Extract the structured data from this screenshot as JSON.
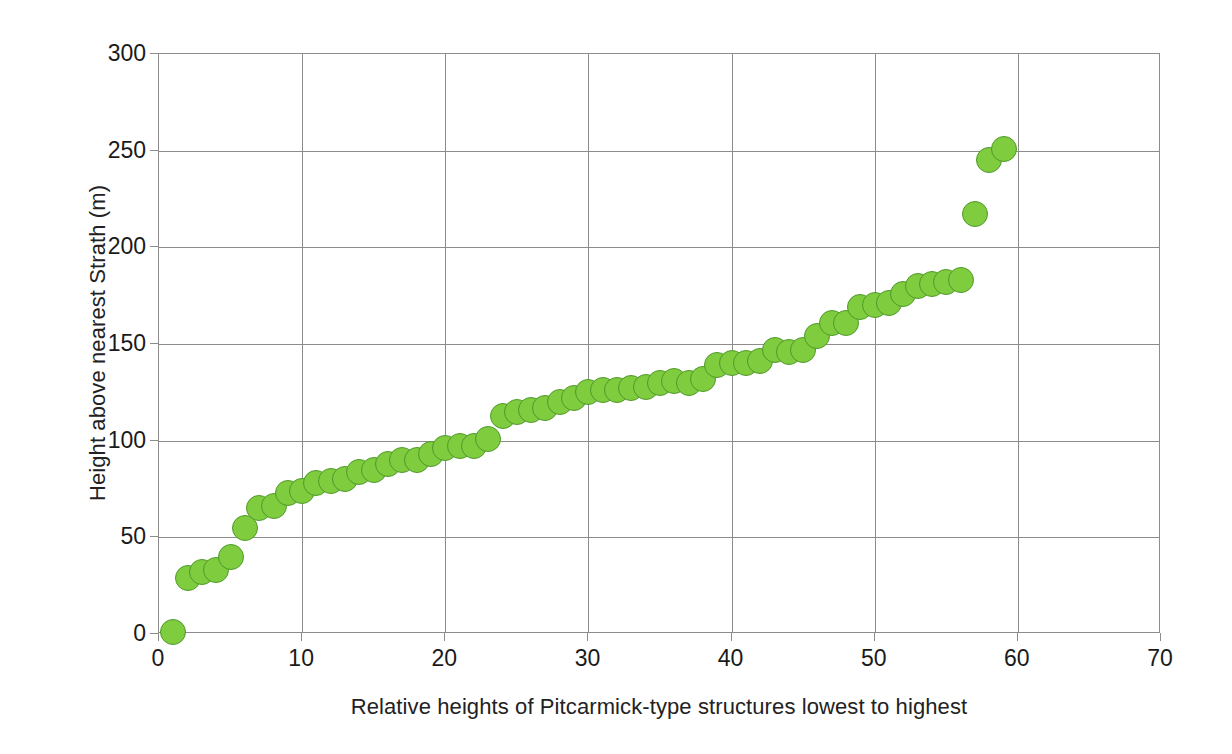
{
  "chart_data": {
    "type": "scatter",
    "title": "",
    "xlabel": "Relative heights of Pitcarmick-type structures lowest to highest",
    "ylabel": "Height above nearest Strath (m)",
    "xlim": [
      0,
      70
    ],
    "ylim": [
      0,
      300
    ],
    "xticks": [
      0,
      10,
      20,
      30,
      40,
      50,
      60,
      70
    ],
    "yticks": [
      0,
      50,
      100,
      150,
      200,
      250,
      300
    ],
    "grid": true,
    "legend": false,
    "marker": {
      "shape": "circle",
      "fill_color": "#7fcc3e",
      "edge_color": "#4e9a2a",
      "size_px": 26
    },
    "series": [
      {
        "name": "Pitcarmick-type structures",
        "points": [
          {
            "x": 1,
            "y": 1
          },
          {
            "x": 2,
            "y": 29
          },
          {
            "x": 3,
            "y": 32
          },
          {
            "x": 4,
            "y": 33
          },
          {
            "x": 5,
            "y": 40
          },
          {
            "x": 6,
            "y": 55
          },
          {
            "x": 7,
            "y": 65
          },
          {
            "x": 8,
            "y": 66
          },
          {
            "x": 9,
            "y": 73
          },
          {
            "x": 10,
            "y": 74
          },
          {
            "x": 11,
            "y": 78
          },
          {
            "x": 12,
            "y": 79
          },
          {
            "x": 13,
            "y": 80
          },
          {
            "x": 14,
            "y": 84
          },
          {
            "x": 15,
            "y": 85
          },
          {
            "x": 16,
            "y": 88
          },
          {
            "x": 17,
            "y": 90
          },
          {
            "x": 18,
            "y": 90
          },
          {
            "x": 19,
            "y": 93
          },
          {
            "x": 20,
            "y": 96
          },
          {
            "x": 21,
            "y": 97
          },
          {
            "x": 22,
            "y": 97
          },
          {
            "x": 23,
            "y": 101
          },
          {
            "x": 24,
            "y": 113
          },
          {
            "x": 25,
            "y": 115
          },
          {
            "x": 26,
            "y": 116
          },
          {
            "x": 27,
            "y": 117
          },
          {
            "x": 28,
            "y": 120
          },
          {
            "x": 29,
            "y": 122
          },
          {
            "x": 30,
            "y": 125
          },
          {
            "x": 31,
            "y": 126
          },
          {
            "x": 32,
            "y": 126
          },
          {
            "x": 33,
            "y": 127
          },
          {
            "x": 34,
            "y": 128
          },
          {
            "x": 35,
            "y": 130
          },
          {
            "x": 36,
            "y": 131
          },
          {
            "x": 37,
            "y": 130
          },
          {
            "x": 38,
            "y": 132
          },
          {
            "x": 39,
            "y": 139
          },
          {
            "x": 40,
            "y": 140
          },
          {
            "x": 41,
            "y": 140
          },
          {
            "x": 42,
            "y": 141
          },
          {
            "x": 43,
            "y": 147
          },
          {
            "x": 44,
            "y": 146
          },
          {
            "x": 45,
            "y": 147
          },
          {
            "x": 46,
            "y": 154
          },
          {
            "x": 47,
            "y": 161
          },
          {
            "x": 48,
            "y": 161
          },
          {
            "x": 49,
            "y": 169
          },
          {
            "x": 50,
            "y": 170
          },
          {
            "x": 51,
            "y": 171
          },
          {
            "x": 52,
            "y": 176
          },
          {
            "x": 53,
            "y": 180
          },
          {
            "x": 54,
            "y": 181
          },
          {
            "x": 55,
            "y": 182
          },
          {
            "x": 56,
            "y": 183
          },
          {
            "x": 57,
            "y": 217
          },
          {
            "x": 58,
            "y": 245
          },
          {
            "x": 59,
            "y": 251
          }
        ]
      }
    ]
  }
}
